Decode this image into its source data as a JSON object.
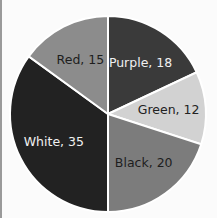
{
  "chart_data": {
    "type": "pie",
    "title": "",
    "start_angle_deg": 0,
    "direction": "clockwise",
    "categories": [
      "Purple",
      "Green",
      "Black",
      "White",
      "Red"
    ],
    "values": [
      18,
      12,
      20,
      35,
      15
    ],
    "labels": [
      "Purple, 18",
      "Green, 12",
      "Black, 20",
      "White, 35",
      "Red, 15"
    ],
    "colors": [
      "#3a3a3a",
      "#d2d2d2",
      "#7c7c7c",
      "#222222",
      "#8c8c8c"
    ],
    "label_colors": [
      "#f0f0f0",
      "#222222",
      "#1e1e1e",
      "#f0f0f0",
      "#1e1e1e"
    ],
    "legend": "none",
    "grid": false
  }
}
